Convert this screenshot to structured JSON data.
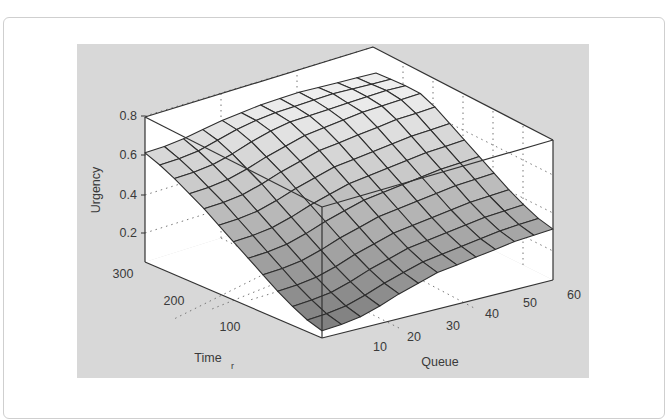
{
  "chart_data": {
    "type": "surface3d",
    "title": "",
    "xlabel": "Queue",
    "ylabel": "Time_r",
    "zlabel": "Urgency",
    "x_ticks": [
      10,
      20,
      30,
      40,
      50,
      60
    ],
    "y_ticks": [
      100,
      200,
      300
    ],
    "z_ticks": [
      0.2,
      0.4,
      0.6,
      0.8
    ],
    "xlim": [
      0,
      60
    ],
    "ylim": [
      0,
      300
    ],
    "zlim": [
      0,
      0.9
    ],
    "grid": true,
    "colormap": "gray",
    "x": [
      0,
      5,
      10,
      15,
      20,
      25,
      30,
      35,
      40,
      45,
      50,
      55,
      60
    ],
    "y": [
      0,
      25,
      50,
      75,
      100,
      125,
      150,
      175,
      200,
      225,
      250,
      275,
      300
    ],
    "z_description": "Urgency rises with both Queue and Time_r: ~0.05 at Queue=0, Time_r=0; ~0.35 along Queue=60 at Time_r=0; ~0.75 along Queue=0 at Time_r=300; plateau ~0.9 at high Queue and high Time_r.",
    "z": [
      [
        0.05,
        0.06,
        0.08,
        0.12,
        0.17,
        0.21,
        0.25,
        0.27,
        0.29,
        0.31,
        0.33,
        0.34,
        0.35
      ],
      [
        0.08,
        0.09,
        0.11,
        0.15,
        0.2,
        0.24,
        0.28,
        0.3,
        0.32,
        0.34,
        0.36,
        0.37,
        0.38
      ],
      [
        0.13,
        0.14,
        0.16,
        0.2,
        0.25,
        0.29,
        0.33,
        0.35,
        0.37,
        0.39,
        0.41,
        0.42,
        0.43
      ],
      [
        0.19,
        0.2,
        0.22,
        0.26,
        0.31,
        0.35,
        0.39,
        0.41,
        0.43,
        0.45,
        0.47,
        0.48,
        0.49
      ],
      [
        0.26,
        0.27,
        0.29,
        0.33,
        0.38,
        0.42,
        0.46,
        0.48,
        0.5,
        0.52,
        0.54,
        0.55,
        0.56
      ],
      [
        0.33,
        0.34,
        0.36,
        0.4,
        0.45,
        0.49,
        0.53,
        0.55,
        0.57,
        0.59,
        0.61,
        0.62,
        0.63
      ],
      [
        0.4,
        0.41,
        0.43,
        0.47,
        0.52,
        0.56,
        0.6,
        0.62,
        0.64,
        0.66,
        0.68,
        0.69,
        0.7
      ],
      [
        0.47,
        0.48,
        0.5,
        0.54,
        0.59,
        0.63,
        0.67,
        0.69,
        0.71,
        0.73,
        0.75,
        0.76,
        0.77
      ],
      [
        0.54,
        0.55,
        0.57,
        0.61,
        0.66,
        0.7,
        0.74,
        0.76,
        0.78,
        0.8,
        0.82,
        0.83,
        0.84
      ],
      [
        0.6,
        0.61,
        0.63,
        0.67,
        0.72,
        0.76,
        0.8,
        0.82,
        0.84,
        0.86,
        0.87,
        0.88,
        0.89
      ],
      [
        0.66,
        0.67,
        0.69,
        0.73,
        0.78,
        0.82,
        0.85,
        0.86,
        0.87,
        0.88,
        0.89,
        0.9,
        0.9
      ],
      [
        0.71,
        0.72,
        0.74,
        0.78,
        0.82,
        0.85,
        0.87,
        0.88,
        0.89,
        0.9,
        0.9,
        0.9,
        0.9
      ],
      [
        0.75,
        0.76,
        0.78,
        0.81,
        0.84,
        0.86,
        0.88,
        0.89,
        0.9,
        0.9,
        0.9,
        0.9,
        0.9
      ]
    ]
  },
  "labels": {
    "zlabel": "Urgency",
    "xlabel": "Queue",
    "ylabel_main": "Time",
    "ylabel_sub": "r",
    "z_tick_0": "0.2",
    "z_tick_1": "0.4",
    "z_tick_2": "0.6",
    "z_tick_3": "0.8",
    "y_tick_0": "100",
    "y_tick_1": "200",
    "y_tick_2": "300",
    "x_tick_0": "10",
    "x_tick_1": "20",
    "x_tick_2": "30",
    "x_tick_3": "40",
    "x_tick_4": "50",
    "x_tick_5": "60"
  }
}
